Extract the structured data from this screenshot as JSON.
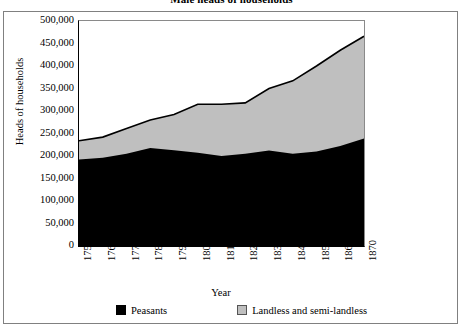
{
  "chart_data": {
    "type": "area",
    "stacked": true,
    "title": "Male heads of households",
    "xlabel": "Year",
    "ylabel": "Heads of households",
    "x": [
      1750,
      1760,
      1770,
      1780,
      1790,
      1800,
      1810,
      1820,
      1830,
      1840,
      1850,
      1860,
      1870
    ],
    "xtick_labels": [
      "1750",
      "1760",
      "1770",
      "1780",
      "1790",
      "1800",
      "1810",
      "1820",
      "1830",
      "1840",
      "1850",
      "1860",
      "1870"
    ],
    "ytick_labels": [
      "500,000",
      "450,000",
      "400,000",
      "350,000",
      "300,000",
      "250,000",
      "200,000",
      "150,000",
      "100,000",
      "50,000",
      "0"
    ],
    "ylim": [
      0,
      500000
    ],
    "ytick_step": 50000,
    "xlim": [
      1750,
      1870
    ],
    "grid": false,
    "legend_position": "bottom",
    "series": [
      {
        "name": "Peasants",
        "color": "#000000",
        "values": [
          192000,
          196000,
          205000,
          218000,
          213000,
          207000,
          200000,
          205000,
          212000,
          205000,
          210000,
          222000,
          239000
        ]
      },
      {
        "name": "Landless and semi-landless",
        "color": "#bfbfbf",
        "values": [
          42000,
          46000,
          56000,
          62000,
          79000,
          108000,
          115000,
          113000,
          138000,
          162000,
          190000,
          213000,
          227000
        ]
      }
    ],
    "totals": [
      234000,
      242000,
      261000,
      280000,
      292000,
      315000,
      315000,
      318000,
      350000,
      367000,
      400000,
      435000,
      466000
    ]
  },
  "legend": {
    "items": [
      {
        "label": "Peasants",
        "swatch": "black-square-swatch"
      },
      {
        "label": "Landless and semi-landless",
        "swatch": "gray-square-swatch"
      }
    ]
  }
}
